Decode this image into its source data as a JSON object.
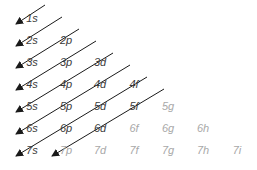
{
  "diagram": {
    "colors": {
      "active": "#3a3a3a",
      "inactive": "#a8a8a8",
      "arrow": "#1a1a1a"
    },
    "orbitals": [
      {
        "label": "1s",
        "col": 0,
        "row": 0,
        "active": true
      },
      {
        "label": "2s",
        "col": 0,
        "row": 1,
        "active": true
      },
      {
        "label": "2p",
        "col": 1,
        "row": 1,
        "active": true
      },
      {
        "label": "3s",
        "col": 0,
        "row": 2,
        "active": true
      },
      {
        "label": "3p",
        "col": 1,
        "row": 2,
        "active": true
      },
      {
        "label": "3d",
        "col": 2,
        "row": 2,
        "active": true
      },
      {
        "label": "4s",
        "col": 0,
        "row": 3,
        "active": true
      },
      {
        "label": "4p",
        "col": 1,
        "row": 3,
        "active": true
      },
      {
        "label": "4d",
        "col": 2,
        "row": 3,
        "active": true
      },
      {
        "label": "4f",
        "col": 3,
        "row": 3,
        "active": true
      },
      {
        "label": "5s",
        "col": 0,
        "row": 4,
        "active": true
      },
      {
        "label": "5p",
        "col": 1,
        "row": 4,
        "active": true
      },
      {
        "label": "5d",
        "col": 2,
        "row": 4,
        "active": true
      },
      {
        "label": "5f",
        "col": 3,
        "row": 4,
        "active": true
      },
      {
        "label": "5g",
        "col": 4,
        "row": 4,
        "active": false
      },
      {
        "label": "6s",
        "col": 0,
        "row": 5,
        "active": true
      },
      {
        "label": "6p",
        "col": 1,
        "row": 5,
        "active": true
      },
      {
        "label": "6d",
        "col": 2,
        "row": 5,
        "active": true
      },
      {
        "label": "6f",
        "col": 3,
        "row": 5,
        "active": false
      },
      {
        "label": "6g",
        "col": 4,
        "row": 5,
        "active": false
      },
      {
        "label": "6h",
        "col": 5,
        "row": 5,
        "active": false
      },
      {
        "label": "7s",
        "col": 0,
        "row": 6,
        "active": true
      },
      {
        "label": "7p",
        "col": 1,
        "row": 6,
        "active": false
      },
      {
        "label": "7d",
        "col": 2,
        "row": 6,
        "active": false
      },
      {
        "label": "7f",
        "col": 3,
        "row": 6,
        "active": false
      },
      {
        "label": "7g",
        "col": 4,
        "row": 6,
        "active": false
      },
      {
        "label": "7h",
        "col": 5,
        "row": 6,
        "active": false
      },
      {
        "label": "7i",
        "col": 6,
        "row": 6,
        "active": false
      }
    ],
    "arrows": [
      {
        "from": [
          45,
          5
        ],
        "to": [
          16,
          24
        ]
      },
      {
        "from": [
          62,
          17
        ],
        "to": [
          16,
          46
        ]
      },
      {
        "from": [
          79,
          29
        ],
        "to": [
          16,
          68
        ]
      },
      {
        "from": [
          96,
          41
        ],
        "to": [
          16,
          90
        ]
      },
      {
        "from": [
          113,
          53
        ],
        "to": [
          16,
          112
        ]
      },
      {
        "from": [
          130,
          65
        ],
        "to": [
          16,
          134
        ]
      },
      {
        "from": [
          147,
          77
        ],
        "to": [
          16,
          156
        ]
      },
      {
        "from": [
          164,
          89
        ],
        "to": [
          52,
          156
        ]
      }
    ]
  }
}
